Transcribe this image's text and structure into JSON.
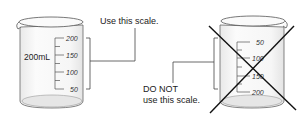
{
  "left_beaker": {
    "capacity_label": "200mL",
    "scale_labels": [
      "200",
      "150",
      "100",
      "50"
    ],
    "callout": "Use this scale."
  },
  "right_beaker": {
    "scale_labels": [
      "50",
      "100",
      "150",
      "200"
    ],
    "callout_line1": "DO NOT",
    "callout_line2": "use this scale.",
    "crossed_out": true
  },
  "colors": {
    "outline": "#555555",
    "glass_fill": "#f4f4f4",
    "bottom_fill": "#e6e6e6",
    "cross": "#111111",
    "text": "#222222"
  }
}
